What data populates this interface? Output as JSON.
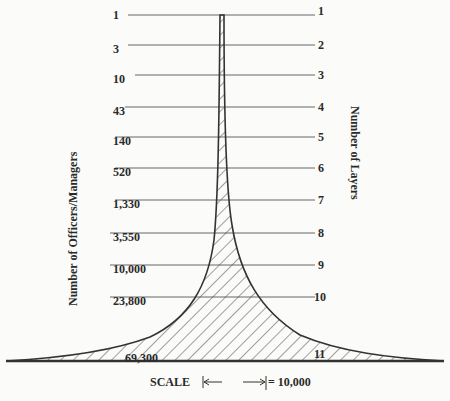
{
  "diagram": {
    "title": "",
    "left_axis_label": "Number of Officers/Managers",
    "right_axis_label": "Number of Layers",
    "layers": [
      {
        "layer": "1",
        "officers": "1",
        "y": 15
      },
      {
        "layer": "2",
        "officers": "3",
        "y": 45
      },
      {
        "layer": "3",
        "officers": "10",
        "y": 75
      },
      {
        "layer": "4",
        "officers": "43",
        "y": 107
      },
      {
        "layer": "5",
        "officers": "140",
        "y": 137
      },
      {
        "layer": "6",
        "officers": "520",
        "y": 168
      },
      {
        "layer": "7",
        "officers": "1,330",
        "y": 200
      },
      {
        "layer": "8",
        "officers": "3,550",
        "y": 233
      },
      {
        "layer": "9",
        "officers": "10,000",
        "y": 265
      },
      {
        "layer": "10",
        "officers": "23,800",
        "y": 297
      },
      {
        "layer": "11",
        "officers": "69,300",
        "y": 330
      }
    ],
    "scale": {
      "label": "SCALE",
      "value": "= 10,000"
    },
    "colors": {
      "ink": "#2a2a2a",
      "line": "#555555",
      "background": "#fbfbf9"
    }
  }
}
